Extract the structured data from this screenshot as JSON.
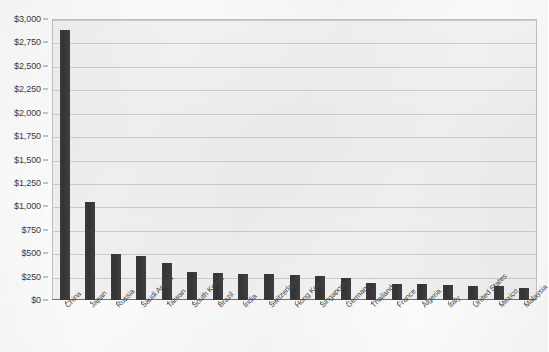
{
  "chart_data": {
    "type": "bar",
    "title": "",
    "xlabel": "",
    "ylabel": "",
    "ylim": [
      0,
      3000
    ],
    "grid": true,
    "legend": "none",
    "orientation": "vertical",
    "bar_color": "#3a3a3a",
    "plot_background": "#eeeeee",
    "y_tick_labels": [
      "$0",
      "$250",
      "$500",
      "$750",
      "$1,000",
      "$1,250",
      "$1,500",
      "$1,750",
      "$2,000",
      "$2,250",
      "$2,500",
      "$2,750",
      "$3,000"
    ],
    "y_tick_values": [
      0,
      250,
      500,
      750,
      1000,
      1250,
      1500,
      1750,
      2000,
      2250,
      2500,
      2750,
      3000
    ],
    "categories": [
      "China",
      "Japan",
      "Russia",
      "Saudi Arabia",
      "Taiwan",
      "South Korea",
      "Brazil",
      "India",
      "Switzerland",
      "Hong Kong",
      "Singapore",
      "Germany",
      "Thailand",
      "France",
      "Algeria",
      "Italy",
      "United States",
      "Mexico",
      "Malaysia"
    ],
    "values": [
      2880,
      1050,
      490,
      465,
      390,
      300,
      285,
      280,
      275,
      265,
      255,
      240,
      180,
      175,
      170,
      165,
      150,
      145,
      130
    ]
  }
}
